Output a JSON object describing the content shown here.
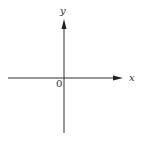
{
  "diagram": {
    "type": "cartesian-axes",
    "x_axis_label": "x",
    "y_axis_label": "y",
    "origin_label": "0",
    "colors": {
      "axis": "#333333",
      "background": "#ffffff"
    }
  }
}
